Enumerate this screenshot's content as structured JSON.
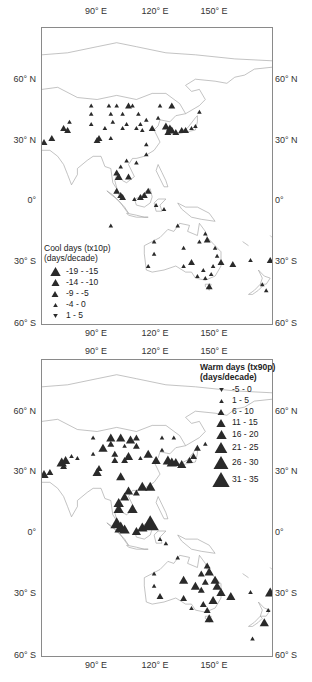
{
  "figure": {
    "panels": [
      {
        "id": "cool",
        "legend_title_line1": "Cool days  (tx10p)",
        "legend_title_line2": "(days/decade)",
        "legend": [
          {
            "label": "-19 - -15",
            "symbol": "triangle-up",
            "size": 9
          },
          {
            "label": "-14 - -10",
            "symbol": "triangle-up",
            "size": 7
          },
          {
            "label": "-9 - -5",
            "symbol": "triangle-up",
            "size": 6
          },
          {
            "label": "-4 - 0",
            "symbol": "triangle-up",
            "size": 4
          },
          {
            "label": "1 - 5",
            "symbol": "triangle-down",
            "size": 4
          }
        ]
      },
      {
        "id": "warm",
        "legend_title_line1": "Warm days  (tx90p)",
        "legend_title_line2": "(days/decade)",
        "legend": [
          {
            "label": "-5 - 0",
            "symbol": "triangle-down",
            "size": 4
          },
          {
            "label": "1 - 5",
            "symbol": "triangle-up",
            "size": 4
          },
          {
            "label": "6 - 10",
            "symbol": "triangle-up",
            "size": 6
          },
          {
            "label": "11 - 15",
            "symbol": "triangle-up",
            "size": 8
          },
          {
            "label": "16 - 20",
            "symbol": "triangle-up",
            "size": 9
          },
          {
            "label": "21 - 25",
            "symbol": "triangle-up",
            "size": 11
          },
          {
            "label": "26 - 30",
            "symbol": "triangle-up",
            "size": 13
          },
          {
            "label": "31 - 35",
            "symbol": "triangle-up",
            "size": 15
          }
        ]
      }
    ],
    "axes": {
      "lon_labels": [
        "90° E",
        "120° E",
        "150° E"
      ],
      "lat_labels_left": [
        "60° N",
        "30° N",
        "0°",
        "30° S",
        "60° S"
      ],
      "lat_labels_right": [
        "60° N",
        "30° N",
        "0°",
        "30° S",
        "60° S"
      ]
    },
    "colors": {
      "marker": "#2a2a2a",
      "coastline": "#9a9a9a",
      "frame": "#8a8a8a"
    }
  },
  "chart_data": [
    {
      "type": "scatter",
      "title": "Cool days (tx10p) trend",
      "units": "days/decade",
      "x_axis": "Longitude",
      "y_axis": "Latitude",
      "xlim": [
        62,
        180
      ],
      "ylim": [
        -60,
        85
      ],
      "x_ticks": [
        "90° E",
        "120° E",
        "150° E"
      ],
      "y_ticks": [
        "60° N",
        "30° N",
        "0°",
        "30° S",
        "60° S"
      ],
      "legend": [
        "-19 - -15",
        "-14 - -10",
        "-9 - -5",
        "-4 - 0",
        "1 - 5"
      ],
      "points": [
        {
          "lon": 63,
          "lat": 29,
          "cls": "-9 - -5"
        },
        {
          "lon": 67,
          "lat": 31,
          "cls": "-9 - -5"
        },
        {
          "lon": 73,
          "lat": 36,
          "cls": "-9 - -5"
        },
        {
          "lon": 75,
          "lat": 35,
          "cls": "-9 - -5"
        },
        {
          "lon": 76,
          "lat": 39,
          "cls": "-4 - 0"
        },
        {
          "lon": 87,
          "lat": 47,
          "cls": "-4 - 0"
        },
        {
          "lon": 87,
          "lat": 43,
          "cls": "-4 - 0"
        },
        {
          "lon": 87,
          "lat": 38,
          "cls": "-4 - 0"
        },
        {
          "lon": 96,
          "lat": 47,
          "cls": "-4 - 0"
        },
        {
          "lon": 100,
          "lat": 47,
          "cls": "-4 - 0"
        },
        {
          "lon": 106,
          "lat": 47,
          "cls": "-9 - -5"
        },
        {
          "lon": 108,
          "lat": 47,
          "cls": "-4 - 0"
        },
        {
          "lon": 111,
          "lat": 43,
          "cls": "-4 - 0"
        },
        {
          "lon": 122,
          "lat": 47,
          "cls": "-4 - 0"
        },
        {
          "lon": 128,
          "lat": 47,
          "cls": "-9 - -5"
        },
        {
          "lon": 97,
          "lat": 43,
          "cls": "-4 - 0"
        },
        {
          "lon": 103,
          "lat": 43,
          "cls": "-4 - 0"
        },
        {
          "lon": 98,
          "lat": 39,
          "cls": "-4 - 0"
        },
        {
          "lon": 105,
          "lat": 38,
          "cls": "-4 - 0"
        },
        {
          "lon": 112,
          "lat": 38,
          "cls": "-4 - 0"
        },
        {
          "lon": 115,
          "lat": 40,
          "cls": "-4 - 0"
        },
        {
          "lon": 121,
          "lat": 41,
          "cls": "-4 - 0"
        },
        {
          "lon": 110,
          "lat": 36,
          "cls": "-4 - 0"
        },
        {
          "lon": 103,
          "lat": 36,
          "cls": "-4 - 0"
        },
        {
          "lon": 94,
          "lat": 36,
          "cls": "-4 - 0"
        },
        {
          "lon": 113,
          "lat": 35,
          "cls": "-4 - 0"
        },
        {
          "lon": 118,
          "lat": 36,
          "cls": "-9 - -5"
        },
        {
          "lon": 90,
          "lat": 30,
          "cls": "-9 - -5"
        },
        {
          "lon": 91,
          "lat": 31,
          "cls": "-9 - -5"
        },
        {
          "lon": 97,
          "lat": 31,
          "cls": "-4 - 0"
        },
        {
          "lon": 115,
          "lat": 28,
          "cls": "-4 - 0"
        },
        {
          "lon": 115,
          "lat": 23,
          "cls": "-4 - 0"
        },
        {
          "lon": 142,
          "lat": 44,
          "cls": "-4 - 0"
        },
        {
          "lon": 125,
          "lat": 37,
          "cls": "-14 - -10"
        },
        {
          "lon": 127,
          "lat": 36,
          "cls": "-14 - -10"
        },
        {
          "lon": 128,
          "lat": 35,
          "cls": "-14 - -10"
        },
        {
          "lon": 126,
          "lat": 34,
          "cls": "-9 - -5"
        },
        {
          "lon": 130,
          "lat": 34,
          "cls": "-9 - -5"
        },
        {
          "lon": 133,
          "lat": 35,
          "cls": "-9 - -5"
        },
        {
          "lon": 135,
          "lat": 35,
          "cls": "-9 - -5"
        },
        {
          "lon": 138,
          "lat": 36,
          "cls": "-4 - 0"
        },
        {
          "lon": 140,
          "lat": 37,
          "cls": "-4 - 0"
        },
        {
          "lon": 105,
          "lat": 20,
          "cls": "-4 - 0"
        },
        {
          "lon": 110,
          "lat": 19,
          "cls": "-4 - 0"
        },
        {
          "lon": 102,
          "lat": 17,
          "cls": "-4 - 0"
        },
        {
          "lon": 100,
          "lat": 14,
          "cls": "-9 - -5"
        },
        {
          "lon": 101,
          "lat": 12,
          "cls": "-14 - -10"
        },
        {
          "lon": 106,
          "lat": 12,
          "cls": "-9 - -5"
        },
        {
          "lon": 100,
          "lat": 5,
          "cls": "-9 - -5"
        },
        {
          "lon": 102,
          "lat": 3,
          "cls": "-9 - -5"
        },
        {
          "lon": 103,
          "lat": 2,
          "cls": "-9 - -5"
        },
        {
          "lon": 109,
          "lat": 1,
          "cls": "-4 - 0"
        },
        {
          "lon": 112,
          "lat": 2,
          "cls": "-9 - -5"
        },
        {
          "lon": 114,
          "lat": 3,
          "cls": "-9 - -5"
        },
        {
          "lon": 116,
          "lat": 5,
          "cls": "-9 - -5"
        },
        {
          "lon": 120,
          "lat": -2,
          "cls": "-4 - 0"
        },
        {
          "lon": 124,
          "lat": -4,
          "cls": "-4 - 0"
        },
        {
          "lon": 97,
          "lat": -12,
          "cls": "-4 - 0"
        },
        {
          "lon": 131,
          "lat": -12,
          "cls": "-4 - 0"
        },
        {
          "lon": 119,
          "lat": -20,
          "cls": "-4 - 0"
        },
        {
          "lon": 119,
          "lat": -26,
          "cls": "-4 - 0"
        },
        {
          "lon": 116,
          "lat": -32,
          "cls": "-4 - 0"
        },
        {
          "lon": 134,
          "lat": -23,
          "cls": "-4 - 0"
        },
        {
          "lon": 138,
          "lat": -30,
          "cls": "-9 - -5"
        },
        {
          "lon": 134,
          "lat": -32,
          "cls": "-4 - 0"
        },
        {
          "lon": 145,
          "lat": -16,
          "cls": "-4 - 0"
        },
        {
          "lon": 146,
          "lat": -19,
          "cls": "-9 - -5"
        },
        {
          "lon": 142,
          "lat": -20,
          "cls": "-4 - 0"
        },
        {
          "lon": 150,
          "lat": -23,
          "cls": "-4 - 0"
        },
        {
          "lon": 151,
          "lat": -27,
          "cls": "-4 - 0"
        },
        {
          "lon": 153,
          "lat": -30,
          "cls": "-9 - -5"
        },
        {
          "lon": 149,
          "lat": -32,
          "cls": "-4 - 0"
        },
        {
          "lon": 144,
          "lat": -34,
          "cls": "-4 - 0"
        },
        {
          "lon": 141,
          "lat": -37,
          "cls": "-4 - 0"
        },
        {
          "lon": 148,
          "lat": -36,
          "cls": "-4 - 0"
        },
        {
          "lon": 145,
          "lat": -38,
          "cls": "-4 - 0"
        },
        {
          "lon": 147,
          "lat": -42,
          "cls": "-9 - -5"
        },
        {
          "lon": 159,
          "lat": -31,
          "cls": "-9 - -5"
        },
        {
          "lon": 168,
          "lat": -29,
          "cls": "-4 - 0"
        },
        {
          "lon": 178,
          "lat": -29,
          "cls": "-9 - -5"
        },
        {
          "lon": 174,
          "lat": -41,
          "cls": "-4 - 0"
        },
        {
          "lon": 176,
          "lat": -44,
          "cls": "-4 - 0"
        }
      ]
    },
    {
      "type": "scatter",
      "title": "Warm days (tx90p) trend",
      "units": "days/decade",
      "x_axis": "Longitude",
      "y_axis": "Latitude",
      "xlim": [
        62,
        180
      ],
      "ylim": [
        -60,
        85
      ],
      "x_ticks": [
        "90° E",
        "120° E",
        "150° E"
      ],
      "y_ticks": [
        "60° N",
        "30° N",
        "0°",
        "30° S",
        "60° S"
      ],
      "legend": [
        "-5 - 0",
        "1 - 5",
        "6 - 10",
        "11 - 15",
        "16 - 20",
        "21 - 25",
        "26 - 30",
        "31 - 35"
      ],
      "points": [
        {
          "lon": 63,
          "lat": 29,
          "cls": "11 - 15"
        },
        {
          "lon": 66,
          "lat": 30,
          "cls": "6 - 10"
        },
        {
          "lon": 72,
          "lat": 35,
          "cls": "16 - 20"
        },
        {
          "lon": 74,
          "lat": 36,
          "cls": "11 - 15"
        },
        {
          "lon": 73,
          "lat": 33,
          "cls": "6 - 10"
        },
        {
          "lon": 77,
          "lat": 38,
          "cls": "1 - 5"
        },
        {
          "lon": 80,
          "lat": 37,
          "cls": "1 - 5"
        },
        {
          "lon": 88,
          "lat": 47,
          "cls": "1 - 5"
        },
        {
          "lon": 97,
          "lat": 47,
          "cls": "11 - 15"
        },
        {
          "lon": 102,
          "lat": 47,
          "cls": "11 - 15"
        },
        {
          "lon": 107,
          "lat": 46,
          "cls": "11 - 15"
        },
        {
          "lon": 110,
          "lat": 47,
          "cls": "6 - 10"
        },
        {
          "lon": 123,
          "lat": 47,
          "cls": "1 - 5"
        },
        {
          "lon": 129,
          "lat": 47,
          "cls": "1 - 5"
        },
        {
          "lon": 97,
          "lat": 44,
          "cls": "6 - 10"
        },
        {
          "lon": 104,
          "lat": 43,
          "cls": "1 - 5"
        },
        {
          "lon": 110,
          "lat": 43,
          "cls": "6 - 10"
        },
        {
          "lon": 93,
          "lat": 42,
          "cls": "11 - 15"
        },
        {
          "lon": 88,
          "lat": 39,
          "cls": "1 - 5"
        },
        {
          "lon": 99,
          "lat": 39,
          "cls": "6 - 10"
        },
        {
          "lon": 106,
          "lat": 38,
          "cls": "11 - 15"
        },
        {
          "lon": 112,
          "lat": 37,
          "cls": "1 - 5"
        },
        {
          "lon": 116,
          "lat": 39,
          "cls": "11 - 15"
        },
        {
          "lon": 123,
          "lat": 41,
          "cls": "1 - 5"
        },
        {
          "lon": 99,
          "lat": 36,
          "cls": "6 - 10"
        },
        {
          "lon": 104,
          "lat": 36,
          "cls": "6 - 10"
        },
        {
          "lon": 120,
          "lat": 36,
          "cls": "11 - 15"
        },
        {
          "lon": 90,
          "lat": 30,
          "cls": "11 - 15"
        },
        {
          "lon": 91,
          "lat": 32,
          "cls": "6 - 10"
        },
        {
          "lon": 102,
          "lat": 28,
          "cls": "11 - 15"
        },
        {
          "lon": 113,
          "lat": 23,
          "cls": "16 - 20"
        },
        {
          "lon": 117,
          "lat": 23,
          "cls": "16 - 20"
        },
        {
          "lon": 106,
          "lat": 21,
          "cls": "11 - 15"
        },
        {
          "lon": 110,
          "lat": 20,
          "cls": "6 - 10"
        },
        {
          "lon": 104,
          "lat": 18,
          "cls": "11 - 15"
        },
        {
          "lon": 126,
          "lat": 36,
          "cls": "16 - 20"
        },
        {
          "lon": 128,
          "lat": 35,
          "cls": "16 - 20"
        },
        {
          "lon": 130,
          "lat": 35,
          "cls": "11 - 15"
        },
        {
          "lon": 133,
          "lat": 34,
          "cls": "11 - 15"
        },
        {
          "lon": 137,
          "lat": 36,
          "cls": "6 - 10"
        },
        {
          "lon": 139,
          "lat": 38,
          "cls": "6 - 10"
        },
        {
          "lon": 141,
          "lat": 42,
          "cls": "6 - 10"
        },
        {
          "lon": 145,
          "lat": 44,
          "cls": "1 - 5"
        },
        {
          "lon": 101,
          "lat": 15,
          "cls": "16 - 20"
        },
        {
          "lon": 101,
          "lat": 12,
          "cls": "16 - 20"
        },
        {
          "lon": 108,
          "lat": 12,
          "cls": "16 - 20"
        },
        {
          "lon": 100,
          "lat": 5,
          "cls": "21 - 25"
        },
        {
          "lon": 102,
          "lat": 3,
          "cls": "21 - 25"
        },
        {
          "lon": 104,
          "lat": 2,
          "cls": "16 - 20"
        },
        {
          "lon": 110,
          "lat": 1,
          "cls": "11 - 15"
        },
        {
          "lon": 113,
          "lat": 3,
          "cls": "16 - 20"
        },
        {
          "lon": 117,
          "lat": 5,
          "cls": "31 - 35"
        },
        {
          "lon": 122,
          "lat": -3,
          "cls": "1 - 5"
        },
        {
          "lon": 125,
          "lat": -5,
          "cls": "1 - 5"
        },
        {
          "lon": 131,
          "lat": -12,
          "cls": "1 - 5"
        },
        {
          "lon": 119,
          "lat": -20,
          "cls": "1 - 5"
        },
        {
          "lon": 119,
          "lat": -26,
          "cls": "1 - 5"
        },
        {
          "lon": 122,
          "lat": -31,
          "cls": "6 - 10"
        },
        {
          "lon": 134,
          "lat": -23,
          "cls": "11 - 15"
        },
        {
          "lon": 140,
          "lat": -26,
          "cls": "11 - 15"
        },
        {
          "lon": 134,
          "lat": -32,
          "cls": "6 - 10"
        },
        {
          "lon": 138,
          "lat": -37,
          "cls": "1 - 5"
        },
        {
          "lon": 146,
          "lat": -16,
          "cls": "6 - 10"
        },
        {
          "lon": 147,
          "lat": -19,
          "cls": "11 - 15"
        },
        {
          "lon": 143,
          "lat": -20,
          "cls": "6 - 10"
        },
        {
          "lon": 145,
          "lat": -24,
          "cls": "6 - 10"
        },
        {
          "lon": 150,
          "lat": -23,
          "cls": "11 - 15"
        },
        {
          "lon": 151,
          "lat": -26,
          "cls": "11 - 15"
        },
        {
          "lon": 153,
          "lat": -29,
          "cls": "11 - 15"
        },
        {
          "lon": 143,
          "lat": -28,
          "cls": "6 - 10"
        },
        {
          "lon": 149,
          "lat": -33,
          "cls": "11 - 15"
        },
        {
          "lon": 144,
          "lat": -35,
          "cls": "6 - 10"
        },
        {
          "lon": 146,
          "lat": -38,
          "cls": "6 - 10"
        },
        {
          "lon": 147,
          "lat": -42,
          "cls": "11 - 15"
        },
        {
          "lon": 158,
          "lat": -31,
          "cls": "11 - 15"
        },
        {
          "lon": 168,
          "lat": -29,
          "cls": "1 - 5"
        },
        {
          "lon": 178,
          "lat": -29,
          "cls": "16 - 20"
        },
        {
          "lon": 177,
          "lat": -38,
          "cls": "1 - 5"
        },
        {
          "lon": 175,
          "lat": -44,
          "cls": "11 - 15"
        },
        {
          "lon": 169,
          "lat": -52,
          "cls": "1 - 5"
        }
      ]
    }
  ]
}
